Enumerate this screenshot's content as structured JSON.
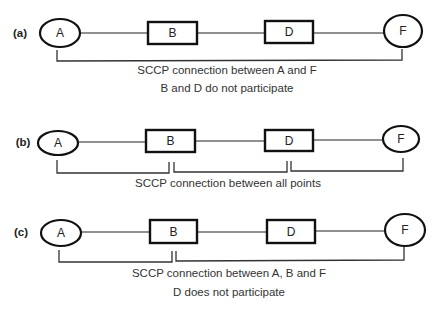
{
  "panels": [
    {
      "label": "(a)",
      "nodes": {
        "A": "A",
        "B": "B",
        "D": "D",
        "F": "F"
      },
      "caption_line1": "SCCP connection between A and F",
      "caption_line2": "B and D do not participate"
    },
    {
      "label": "(b)",
      "nodes": {
        "A": "A",
        "B": "B",
        "D": "D",
        "F": "F"
      },
      "caption_line1": "SCCP connection between all points",
      "caption_line2": ""
    },
    {
      "label": "(c)",
      "nodes": {
        "A": "A",
        "B": "B",
        "D": "D",
        "F": "F"
      },
      "caption_line1": "SCCP connection between A, B and F",
      "caption_line2": "D does not participate"
    }
  ],
  "colors": {
    "stroke": "#111111",
    "text": "#222222",
    "background": "#ffffff"
  }
}
